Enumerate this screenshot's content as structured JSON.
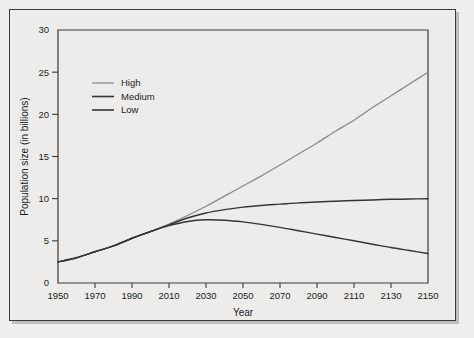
{
  "chart_data": {
    "type": "line",
    "title": "",
    "xlabel": "Year",
    "ylabel": "Population size (in billions)",
    "xlim": [
      1950,
      2150
    ],
    "ylim": [
      0,
      30
    ],
    "xticks": [
      1950,
      1970,
      1990,
      2010,
      2030,
      2050,
      2070,
      2090,
      2110,
      2130,
      2150
    ],
    "yticks": [
      0,
      5,
      10,
      15,
      20,
      25,
      30
    ],
    "grid": false,
    "legend_position": "top-left-inside",
    "x": [
      1950,
      1960,
      1970,
      1980,
      1990,
      2000,
      2010,
      2020,
      2030,
      2040,
      2050,
      2060,
      2070,
      2080,
      2090,
      2100,
      2110,
      2120,
      2130,
      2140,
      2150
    ],
    "series": [
      {
        "name": "High",
        "color": "#8a8a8a",
        "values": [
          2.5,
          3.0,
          3.7,
          4.4,
          5.3,
          6.1,
          7.0,
          8.0,
          9.1,
          10.3,
          11.5,
          12.7,
          14.0,
          15.3,
          16.6,
          18.0,
          19.3,
          20.8,
          22.2,
          23.6,
          25.0
        ]
      },
      {
        "name": "Medium",
        "color": "#343434",
        "values": [
          2.5,
          3.0,
          3.7,
          4.4,
          5.3,
          6.1,
          6.9,
          7.7,
          8.3,
          8.7,
          9.0,
          9.2,
          9.35,
          9.5,
          9.6,
          9.7,
          9.78,
          9.85,
          9.92,
          9.96,
          10.0
        ]
      },
      {
        "name": "Low",
        "color": "#343434",
        "values": [
          2.5,
          3.0,
          3.7,
          4.4,
          5.3,
          6.1,
          6.8,
          7.3,
          7.5,
          7.45,
          7.25,
          6.95,
          6.6,
          6.2,
          5.8,
          5.4,
          5.0,
          4.6,
          4.2,
          3.85,
          3.5
        ]
      }
    ]
  },
  "legend": {
    "items": [
      {
        "label": "High"
      },
      {
        "label": "Medium"
      },
      {
        "label": "Low"
      }
    ]
  },
  "axes": {
    "x_title": "Year",
    "y_title": "Population size (in billions)",
    "x_tick_labels": [
      "1950",
      "1970",
      "1990",
      "2010",
      "2030",
      "2050",
      "2070",
      "2090",
      "2110",
      "2130",
      "2150"
    ],
    "y_tick_labels": [
      "0",
      "5",
      "10",
      "15",
      "20",
      "25",
      "30"
    ]
  },
  "colors": {
    "background": "#edecea",
    "frame": "#3b3b3b",
    "high_line": "#8a8a8a",
    "medium_line": "#343434",
    "low_line": "#343434",
    "text": "#1c1c1c"
  }
}
